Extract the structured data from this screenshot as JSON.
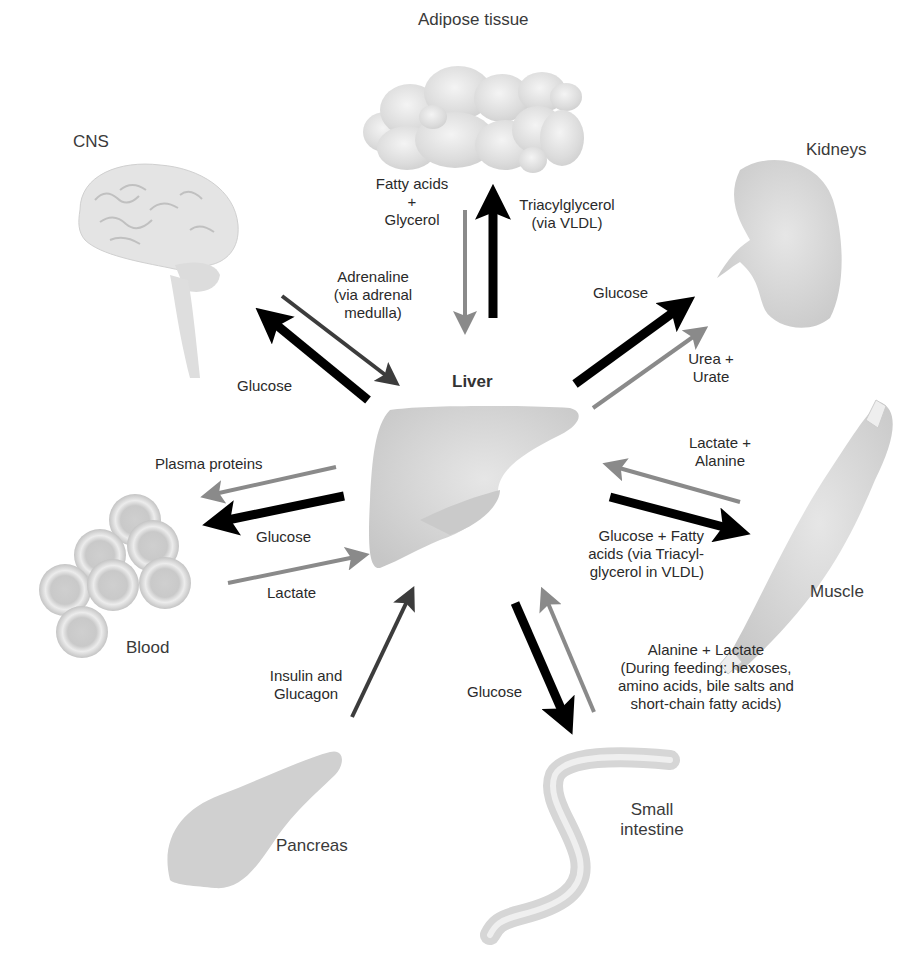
{
  "diagram": {
    "center": {
      "label": "Liver"
    },
    "organs": {
      "adipose": "Adipose tissue",
      "cns": "CNS",
      "kidneys": "Kidneys",
      "muscle": "Muscle",
      "blood": "Blood",
      "pancreas": "Pancreas",
      "small_intestine": [
        "Small",
        "intestine"
      ]
    },
    "flows": {
      "adipose_to_liver": [
        "Fatty acids",
        "+",
        "Glycerol"
      ],
      "liver_to_adipose": [
        "Triacylglycerol",
        "(via VLDL)"
      ],
      "cns_to_liver": [
        "Adrenaline",
        "(via adrenal",
        "medulla)"
      ],
      "liver_to_cns": "Glucose",
      "liver_to_kidneys": "Glucose",
      "kidneys_from_liver_2": [
        "Urea +",
        "Urate"
      ],
      "muscle_to_liver": [
        "Lactate +",
        "Alanine"
      ],
      "liver_to_muscle": [
        "Glucose + Fatty",
        "acids (via Triacyl-",
        "glycerol  in VLDL)"
      ],
      "liver_to_blood_1": "Plasma proteins",
      "liver_to_blood_2": "Glucose",
      "blood_to_liver": "Lactate",
      "pancreas_to_liver": [
        "Insulin and",
        "Glucagon"
      ],
      "liver_to_intestine": "Glucose",
      "intestine_to_liver": [
        "Alanine + Lactate",
        "(During feeding: hexoses,",
        "amino acids, bile salts and",
        "short-chain fatty acids)"
      ]
    },
    "legend_colors": {
      "black_arrow": "#000000",
      "gray_arrow": "#8a8a8a",
      "dark_gray_arrow": "#3c3c3c",
      "organ_fill": "#d6d6d6"
    }
  }
}
